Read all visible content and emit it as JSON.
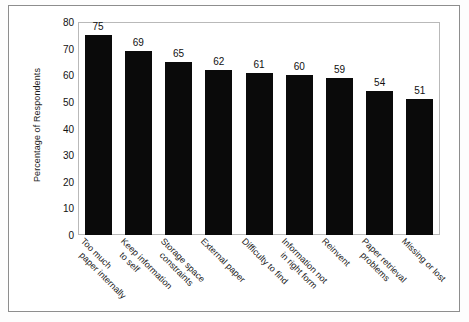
{
  "chart_data": {
    "type": "bar",
    "title": "",
    "xlabel": "",
    "ylabel": "Percentage of Respondents",
    "ylim": [
      0,
      80
    ],
    "yticks": [
      0,
      10,
      20,
      30,
      40,
      50,
      60,
      70,
      80
    ],
    "grid": false,
    "legend": null,
    "orientation": "vertical",
    "bar_color": "#0a0a0a",
    "value_labels_shown": true,
    "categories": [
      "Too much paper internally",
      "Keep information to self",
      "Storage space constraints",
      "External paper",
      "Difficulty to find",
      "Information not in right form",
      "Reinvent",
      "Paper retrieval problems",
      "Missing or lost"
    ],
    "category_lines": [
      [
        "Too much",
        "paper internally"
      ],
      [
        "Keep information",
        "to self"
      ],
      [
        "Storage space",
        "constraints"
      ],
      [
        "External paper",
        ""
      ],
      [
        "Difficulty to find",
        ""
      ],
      [
        "Information not",
        "in right form"
      ],
      [
        "Reinvent",
        ""
      ],
      [
        "Paper retrieval",
        "problems"
      ],
      [
        "Missing or lost",
        ""
      ]
    ],
    "values": [
      75,
      69,
      65,
      62,
      61,
      60,
      59,
      54,
      51
    ]
  },
  "colors": {
    "bar": "#0a0a0a",
    "plot_border": "#b9b9b9",
    "outer_border": "#8d8d8d",
    "background": "#ffffff",
    "text": "#121212"
  }
}
